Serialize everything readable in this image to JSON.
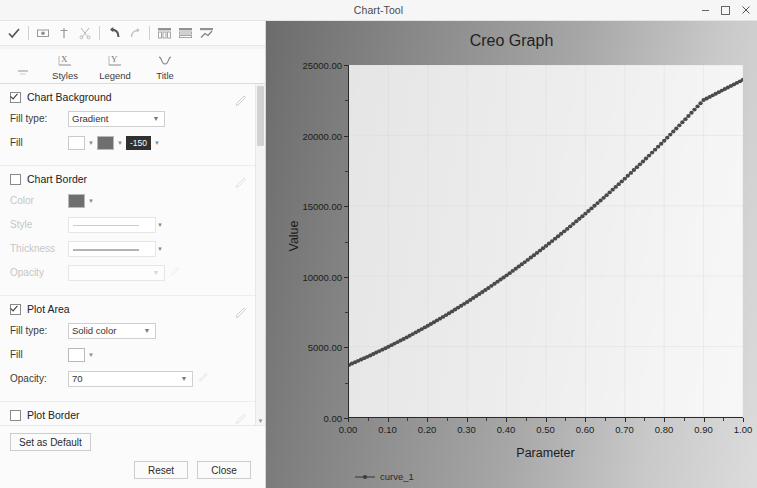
{
  "window": {
    "title": "Chart-Tool",
    "minimize_label": "–",
    "maximize_label": "□",
    "close_label": "✕"
  },
  "toolbar": {
    "buttons": [
      {
        "name": "apply-check-icon",
        "label": "Apply"
      },
      {
        "name": "show-hide-icon",
        "label": "Show"
      },
      {
        "name": "add-icon",
        "label": "Add"
      },
      {
        "name": "cut-icon",
        "label": "Cut"
      },
      {
        "name": "undo-icon",
        "label": "Undo"
      },
      {
        "name": "redo-icon",
        "label": "Redo"
      },
      {
        "name": "grid-columns-icon",
        "label": "Columns"
      },
      {
        "name": "grid-rows-icon",
        "label": "Rows"
      },
      {
        "name": "chart-style-icon",
        "label": "Style"
      }
    ]
  },
  "tabs": [
    {
      "label": "",
      "icon": "dash-icon"
    },
    {
      "label": "Styles",
      "icon": "x-axis-icon"
    },
    {
      "label": "Legend",
      "icon": "y-axis-icon"
    },
    {
      "label": "Title",
      "icon": "curve-icon"
    }
  ],
  "sections": {
    "chart_background": {
      "title": "Chart Background",
      "checked": true,
      "fill_type_label": "Fill type:",
      "fill_type_value": "Gradient",
      "fill_label": "Fill",
      "fill_color_1": "#ffffff",
      "fill_color_2": "#6f6f6f",
      "fill_angle_value": "-150",
      "edit_icon": "pencil-icon"
    },
    "chart_border": {
      "title": "Chart Border",
      "checked": false,
      "color_label": "Color",
      "color_value": "#6f6f6f",
      "style_label": "Style",
      "thickness_label": "Thickness",
      "opacity_label": "Opacity",
      "opacity_value": "",
      "edit_icon": "pencil-icon"
    },
    "plot_area": {
      "title": "Plot Area",
      "checked": true,
      "fill_type_label": "Fill type:",
      "fill_type_value": "Solid color",
      "fill_label": "Fill",
      "fill_color": "#ffffff",
      "opacity_label": "Opacity:",
      "opacity_value": "70",
      "edit_icon": "pencil-icon"
    },
    "plot_border": {
      "title": "Plot Border",
      "checked": false,
      "edit_icon": "pencil-icon"
    }
  },
  "buttons": {
    "set_default": "Set as Default",
    "reset": "Reset",
    "close": "Close"
  },
  "chart_data": {
    "type": "line",
    "title": "Creo Graph",
    "xlabel": "Parameter",
    "ylabel": "Value",
    "xlim": [
      0.0,
      1.0
    ],
    "ylim": [
      0.0,
      25000.0
    ],
    "grid": true,
    "legend_position": "bottom-left",
    "x_ticks": [
      "0.00",
      "0.10",
      "0.20",
      "0.30",
      "0.40",
      "0.50",
      "0.60",
      "0.70",
      "0.80",
      "0.90",
      "1.00"
    ],
    "x_tick_values": [
      0.0,
      0.1,
      0.2,
      0.3,
      0.4,
      0.5,
      0.6,
      0.7,
      0.8,
      0.9,
      1.0
    ],
    "y_ticks": [
      "0.00",
      "5000.00",
      "10000.00",
      "15000.00",
      "20000.00",
      "25000.00"
    ],
    "y_tick_values": [
      0,
      5000,
      10000,
      15000,
      20000,
      25000
    ],
    "series": [
      {
        "name": "curve_1",
        "color": "#4a4a4a",
        "marker": "dot",
        "x": [
          0.0,
          0.05,
          0.1,
          0.15,
          0.2,
          0.25,
          0.3,
          0.35,
          0.4,
          0.45,
          0.5,
          0.55,
          0.6,
          0.65,
          0.7,
          0.75,
          0.8,
          0.85,
          0.9,
          0.95,
          1.0
        ],
        "values": [
          3700,
          4320,
          4990,
          5710,
          6480,
          7300,
          8170,
          9090,
          10060,
          11080,
          12150,
          13270,
          14440,
          15660,
          16930,
          18250,
          19620,
          21040,
          22510,
          23240,
          23950
        ]
      }
    ]
  }
}
